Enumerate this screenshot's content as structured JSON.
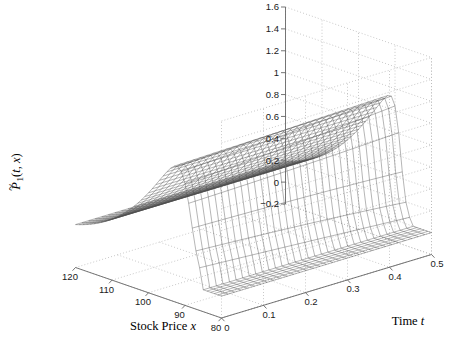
{
  "figure": {
    "background_color": "#ffffff",
    "width": 475,
    "height": 353
  },
  "chart_data": {
    "type": "surface",
    "title": "",
    "xlabel_text": "Stock Price ",
    "xlabel_var": "x",
    "ylabel_text": "Time ",
    "ylabel_var": "t",
    "zlabel_text": "P̃₁(t, x)",
    "x_name": "Stock Price x",
    "y_name": "Time t",
    "z_name": "P1(t,x)",
    "x_ticks": [
      120,
      110,
      100,
      90,
      80
    ],
    "x_tick_labels": [
      "120",
      "110",
      "100",
      "90",
      "80"
    ],
    "y_ticks": [
      0,
      0.1,
      0.2,
      0.3,
      0.4,
      0.5
    ],
    "y_tick_labels": [
      "0",
      "0.1",
      "0.2",
      "0.3",
      "0.4",
      "0.5"
    ],
    "z_ticks": [
      -0.2,
      0,
      0.2,
      0.4,
      0.6,
      0.8,
      1.0,
      1.2,
      1.4,
      1.6
    ],
    "z_tick_labels": [
      "−0.2",
      "0",
      "0.2",
      "0.4",
      "0.6",
      "0.8",
      "1",
      "1.2",
      "1.4",
      "1.6"
    ],
    "xlim": [
      80,
      120
    ],
    "ylim": [
      0,
      0.5
    ],
    "zlim": [
      -0.2,
      1.6
    ],
    "grid": true,
    "grid_style": "dotted",
    "mesh_color": "#4d4d4d",
    "grid_color": "#b8b8b8",
    "axis_color": "#666666",
    "legend": null,
    "view": {
      "azimuth": -37.5,
      "elevation": 26
    },
    "surface_description": "Ridge rising from ~0.1 at x=120 to plateau ~1.28 near x=100-95, steep cliff down to 0 for x<88; flat zero plane over remaining region; shape nearly constant across time t",
    "nx": 41,
    "ny": 33,
    "plateau_height": 1.28,
    "front_edge_height": 0.1,
    "cliff_x": 88.5
  }
}
